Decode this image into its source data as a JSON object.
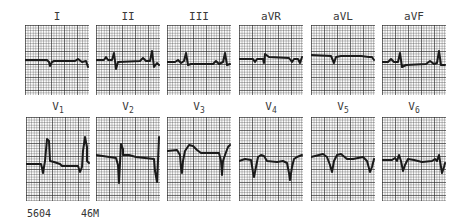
{
  "leads_top": [
    {
      "name": "I",
      "label": "I"
    },
    {
      "name": "II",
      "label": "II"
    },
    {
      "name": "III",
      "label": "III"
    },
    {
      "name": "aVR",
      "label": "aVR"
    },
    {
      "name": "aVL",
      "label": "aVL"
    },
    {
      "name": "aVF",
      "label": "aVF"
    }
  ],
  "leads_bottom": [
    {
      "name": "V1",
      "label": "V",
      "sub": "1"
    },
    {
      "name": "V2",
      "label": "V",
      "sub": "2"
    },
    {
      "name": "V3",
      "label": "V",
      "sub": "3"
    },
    {
      "name": "V4",
      "label": "V",
      "sub": "4"
    },
    {
      "name": "V5",
      "label": "V",
      "sub": "5"
    },
    {
      "name": "V6",
      "label": "V",
      "sub": "6"
    }
  ],
  "footer": {
    "id": "5604",
    "patient": "46M"
  },
  "colors": {
    "trace": "#1a1a1a",
    "grid": "#333333",
    "paper": "#fbfbfb"
  }
}
